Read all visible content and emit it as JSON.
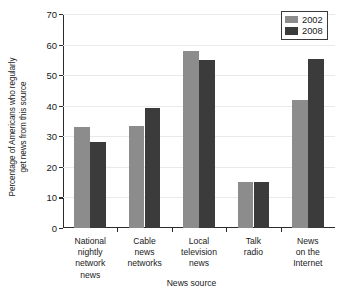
{
  "chart_data": {
    "type": "bar",
    "title": "",
    "xlabel": "News source",
    "ylabel": "Percentage of Americans who regularly get news from this source",
    "ylabel_line1": "Percentage of Americans who regularly",
    "ylabel_line2": "get news from this source",
    "categories": [
      "National\nnightly\nnetwork\nnews",
      "Cable\nnews\nnetworks",
      "Local\ntelevision\nnews",
      "Talk\nradio",
      "News\non the\nInternet"
    ],
    "series": [
      {
        "name": "2002",
        "color": "#8c8c8c",
        "values": [
          33.2,
          33.5,
          58.0,
          15.2,
          41.8
        ]
      },
      {
        "name": "2008",
        "color": "#3b3b3b",
        "values": [
          28.2,
          39.3,
          54.9,
          15.0,
          55.4
        ]
      }
    ],
    "ylim": [
      0,
      70
    ],
    "ytick_labels": [
      "0",
      "10",
      "20",
      "30",
      "40",
      "50",
      "60",
      "70"
    ],
    "ytick_values": [
      0,
      10,
      20,
      30,
      40,
      50,
      60,
      70
    ],
    "grid": true,
    "legend_position": "top-right",
    "legend_entries": [
      "2002",
      "2008"
    ]
  },
  "axes": {
    "y_title_line1": "Percentage of Americans who regularly",
    "y_title_line2": "get news from this source",
    "x_title": "News source"
  },
  "colors": {
    "series_2002": "#8c8c8c",
    "series_2008": "#3b3b3b",
    "axis": "#2b2b2b",
    "grid": "#e9e9e9",
    "background": "#ffffff"
  }
}
